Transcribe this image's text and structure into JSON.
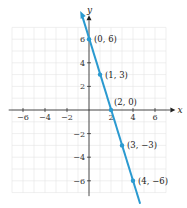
{
  "chart_data": {
    "type": "line",
    "title": "",
    "xlabel": "x",
    "ylabel": "y",
    "xlim": [
      -7,
      7
    ],
    "ylim": [
      -7,
      7
    ],
    "grid": true,
    "x_ticks": [
      -6,
      -4,
      -2,
      2,
      4,
      6
    ],
    "y_ticks": [
      -6,
      -4,
      -2,
      2,
      4,
      6
    ],
    "x_tick_labels": [
      "−6",
      "−4",
      "−2",
      "2",
      "4",
      "6"
    ],
    "y_tick_labels": [
      "−6",
      "−4",
      "−2",
      "2",
      "4",
      "6"
    ],
    "series": [
      {
        "name": "y = -3x + 6",
        "color": "#2b9ad0",
        "x": [
          0,
          1,
          2,
          3,
          4
        ],
        "y": [
          6,
          3,
          0,
          -3,
          -6
        ]
      }
    ],
    "annotations": [
      "(0, 6)",
      "(1, 3)",
      "(2, 0)",
      "(3, −3)",
      "(4, −6)"
    ],
    "legend": "none"
  }
}
